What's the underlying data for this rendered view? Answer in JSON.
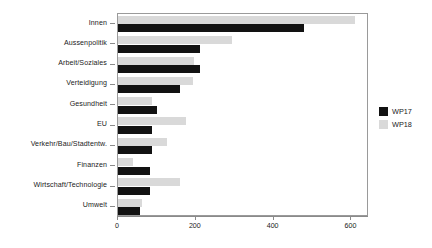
{
  "chart_data": {
    "type": "bar",
    "orientation": "horizontal",
    "title": "",
    "xlabel": "",
    "ylabel": "",
    "xlim": [
      0,
      645
    ],
    "xticks": [
      0,
      200,
      400,
      600
    ],
    "xticklabels": [
      "0",
      "200",
      "400",
      "600"
    ],
    "grid": false,
    "legend_position": "right",
    "categories": [
      "Innen",
      "Aussenpolitik",
      "Arbeit/Soziales",
      "Verteidigung",
      "Gesundheit",
      "EU",
      "Verkehr/Bau/Stadtentw.",
      "Finanzen",
      "Wirtschaft/Technologie",
      "Umwelt"
    ],
    "series": [
      {
        "name": "WP17",
        "color": "#121212",
        "values": [
          479,
          210,
          210,
          159,
          100,
          87,
          87,
          82,
          82,
          56
        ]
      },
      {
        "name": "WP18",
        "color": "#d9d9d9",
        "values": [
          608,
          292,
          195,
          192,
          87,
          174,
          126,
          38,
          159,
          62
        ]
      }
    ]
  },
  "legend": {
    "entries": [
      {
        "label": "WP17",
        "color": "#121212"
      },
      {
        "label": "WP18",
        "color": "#d9d9d9"
      }
    ]
  }
}
